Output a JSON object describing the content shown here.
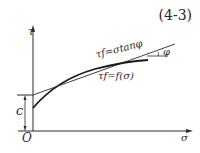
{
  "equation_number": "(4-3)",
  "axes": {
    "y_label": "τ",
    "x_label": "σ",
    "origin_label": "O"
  },
  "annotations": {
    "cohesion_label": "c",
    "line_label": "τf=σtanφ",
    "curve_label": "τf=f(σ)",
    "angle_label": "φ"
  },
  "colors": {
    "ink": "#2a2a2a",
    "background": "#ffffff"
  }
}
